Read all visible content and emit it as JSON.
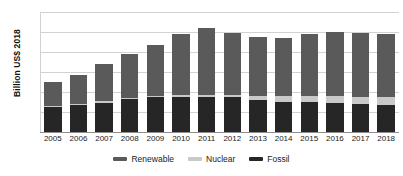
{
  "chart_data": {
    "type": "bar",
    "stacked": true,
    "title": "",
    "xlabel": "",
    "ylabel": "Billion US$ 2018",
    "ylim": [
      0,
      600
    ],
    "ytick_step": 100,
    "yticks": [
      0,
      100,
      200,
      300,
      400,
      500,
      600
    ],
    "grid": true,
    "legend_position": "bottom",
    "categories": [
      "2005",
      "2006",
      "2007",
      "2008",
      "2009",
      "2010",
      "2011",
      "2012",
      "2013",
      "2014",
      "2015",
      "2016",
      "2017",
      "2018"
    ],
    "series": [
      {
        "name": "Fossil",
        "color": "#262626",
        "values": [
          125,
          133,
          147,
          165,
          175,
          176,
          176,
          173,
          160,
          152,
          148,
          146,
          139,
          134
        ]
      },
      {
        "name": "Nuclear",
        "color": "#c9c9c9",
        "values": [
          6,
          6,
          6,
          7,
          7,
          7,
          7,
          10,
          22,
          28,
          30,
          33,
          38,
          40
        ]
      },
      {
        "name": "Renewable",
        "color": "#5a5a5a",
        "values": [
          121,
          145,
          187,
          220,
          255,
          305,
          335,
          313,
          294,
          292,
          314,
          321,
          317,
          314
        ]
      }
    ],
    "totals": [
      252,
      284,
      340,
      392,
      437,
      488,
      518,
      496,
      476,
      472,
      492,
      500,
      494,
      488
    ]
  },
  "axis": {
    "y_title": "Billion US$ 2018",
    "y_tick_labels": [
      "600",
      "500",
      "400",
      "300",
      "200",
      "100",
      "0"
    ]
  },
  "legend": {
    "items": [
      {
        "label": "Renewable",
        "color": "#5a5a5a"
      },
      {
        "label": "Nuclear",
        "color": "#c9c9c9"
      },
      {
        "label": "Fossil",
        "color": "#262626"
      }
    ]
  }
}
